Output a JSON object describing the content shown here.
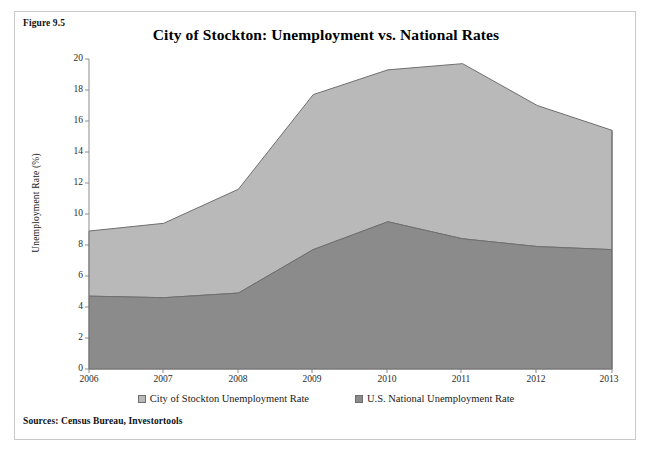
{
  "figure": {
    "label": "Figure 9.5",
    "title": "City of Stockton: Unemployment vs. National Rates",
    "source_note": "Sources: Census Bureau, Investortools"
  },
  "legend": {
    "position": "bottom",
    "entries": [
      {
        "label": "City of Stockton Unemployment Rate",
        "color": "#b9b9b9",
        "marker": "square-swatch"
      },
      {
        "label": "U.S. National Unemployment Rate",
        "color": "#8b8b8b",
        "marker": "square-swatch"
      }
    ]
  },
  "axes": {
    "y_title": "Unemployment Rate (%)",
    "y_ticks": [
      "0",
      "2",
      "4",
      "6",
      "8",
      "10",
      "12",
      "14",
      "16",
      "18",
      "20"
    ],
    "x_ticks": [
      "2006",
      "2007",
      "2008",
      "2009",
      "2010",
      "2011",
      "2012",
      "2013"
    ]
  },
  "chart_data": {
    "type": "area",
    "stacked": true,
    "title": "City of Stockton: Unemployment vs. National Rates",
    "xlabel": "",
    "ylabel": "Unemployment Rate (%)",
    "categories": [
      "2006",
      "2007",
      "2008",
      "2009",
      "2010",
      "2011",
      "2012",
      "2013"
    ],
    "ylim": [
      0,
      20
    ],
    "ytick_step": 2,
    "xlim": [
      "2006",
      "2013"
    ],
    "grid": false,
    "legend_position": "bottom",
    "series": [
      {
        "name": "U.S. National Unemployment Rate",
        "color": "#8b8b8b",
        "stack_order": 1,
        "values": [
          4.7,
          4.6,
          4.9,
          7.7,
          9.5,
          8.4,
          7.9,
          7.7
        ]
      },
      {
        "name": "City of Stockton Unemployment Rate",
        "color": "#b9b9b9",
        "stack_order": 2,
        "values": [
          4.2,
          4.8,
          6.7,
          10.0,
          9.8,
          11.3,
          9.1,
          7.7
        ]
      }
    ],
    "cumulative_top": [
      8.9,
      9.4,
      11.6,
      17.7,
      19.3,
      19.7,
      17.0,
      15.4
    ],
    "source": "Sources: Census Bureau, Investortools"
  }
}
